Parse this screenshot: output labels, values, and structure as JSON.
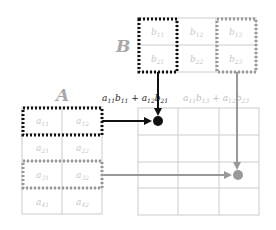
{
  "diagram": {
    "matrix_a": {
      "label": "A",
      "cells": [
        [
          "a11",
          "a12"
        ],
        [
          "a21",
          "a22"
        ],
        [
          "a31",
          "a32"
        ],
        [
          "a41",
          "a42"
        ]
      ],
      "cells_display": [
        [
          {
            "base": "a",
            "sub": "11"
          },
          {
            "base": "a",
            "sub": "12"
          }
        ],
        [
          {
            "base": "a",
            "sub": "21"
          },
          {
            "base": "a",
            "sub": "22"
          }
        ],
        [
          {
            "base": "a",
            "sub": "31"
          },
          {
            "base": "a",
            "sub": "32"
          }
        ],
        [
          {
            "base": "a",
            "sub": "41"
          },
          {
            "base": "a",
            "sub": "42"
          }
        ]
      ],
      "highlighted_rows": [
        {
          "row": 1,
          "style": "black-dotted"
        },
        {
          "row": 3,
          "style": "gray-dotted"
        }
      ]
    },
    "matrix_b": {
      "label": "B",
      "cells_display": [
        [
          {
            "base": "b",
            "sub": "11"
          },
          {
            "base": "b",
            "sub": "12"
          },
          {
            "base": "b",
            "sub": "13"
          }
        ],
        [
          {
            "base": "b",
            "sub": "21"
          },
          {
            "base": "b",
            "sub": "22"
          },
          {
            "base": "b",
            "sub": "23"
          }
        ]
      ],
      "highlighted_cols": [
        {
          "col": 1,
          "style": "black-dotted"
        },
        {
          "col": 3,
          "style": "gray-dotted"
        }
      ]
    },
    "matrix_c": {
      "rows": 4,
      "cols": 3,
      "filled": [
        {
          "row": 1,
          "col": 1,
          "color": "#111111"
        },
        {
          "row": 3,
          "col": 3,
          "color": "#999999"
        }
      ]
    },
    "formulas": [
      {
        "text": "a11b11 + a12b21",
        "color": "#222222"
      },
      {
        "text": "a11b13 + a12b23",
        "color": "#c0c0c0"
      }
    ],
    "colors": {
      "black": "#111111",
      "gray": "#999999",
      "grid": "#cccccc",
      "cell_text": "#c8c8c8",
      "label": "#a8a8a8"
    }
  }
}
